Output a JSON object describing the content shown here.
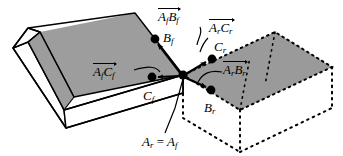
{
  "figure": {
    "background_color": "#ffffff",
    "stroke_color": "#000000",
    "gray_fill": "#9d9d9d",
    "gray_fill_right": "#9a9a9a",
    "solid_object_label": "open box (forward frame)",
    "dotted_object_label": "open box (reverse frame)"
  },
  "labels": {
    "vec_AfBf": {
      "base": "A",
      "sub1": "f",
      "base2": "B",
      "sub2": "f"
    },
    "vec_ArCr": {
      "base": "A",
      "sub1": "r",
      "base2": "C",
      "sub2": "r"
    },
    "vec_AfCf": {
      "base": "A",
      "sub1": "f",
      "base2": "C",
      "sub2": "f"
    },
    "vec_ArBr": {
      "base": "A",
      "sub1": "r",
      "base2": "B",
      "sub2": "r"
    },
    "point_Bf": {
      "base": "B",
      "sub": "f"
    },
    "point_Cr": {
      "base": "C",
      "sub": "r"
    },
    "point_Cf": {
      "base": "C",
      "sub": "f"
    },
    "point_Br": {
      "base": "B",
      "sub": "r"
    },
    "point_ArAf": {
      "left": "A",
      "left_sub": "r",
      "eq": "=",
      "right": "A",
      "right_sub": "f"
    }
  },
  "points": {
    "A": {
      "x": 183,
      "y": 75,
      "name": "A_r = A_f"
    },
    "Bf": {
      "x": 155,
      "y": 39,
      "name": "B_f"
    },
    "Cf": {
      "x": 152,
      "y": 77,
      "name": "C_f"
    },
    "Cr": {
      "x": 212,
      "y": 59,
      "name": "C_r"
    },
    "Br": {
      "x": 211,
      "y": 90,
      "name": "B_r"
    }
  }
}
